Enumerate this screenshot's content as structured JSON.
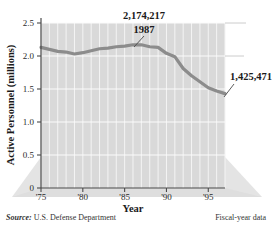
{
  "chart_data": {
    "type": "line",
    "title": "",
    "xlabel": "Year",
    "ylabel": "Active Personnel (millions)",
    "xlim": [
      1975,
      1997
    ],
    "ylim": [
      0,
      2.5
    ],
    "grid": true,
    "legend": "none",
    "x": [
      1975,
      1976,
      1977,
      1978,
      1979,
      1980,
      1981,
      1982,
      1983,
      1984,
      1985,
      1986,
      1987,
      1988,
      1989,
      1990,
      1991,
      1992,
      1993,
      1994,
      1995,
      1996,
      1997
    ],
    "values": [
      2.13,
      2.1,
      2.07,
      2.06,
      2.03,
      2.05,
      2.08,
      2.11,
      2.12,
      2.14,
      2.15,
      2.17,
      2.17,
      2.14,
      2.13,
      2.04,
      1.99,
      1.81,
      1.7,
      1.61,
      1.52,
      1.47,
      1.43
    ],
    "ytick_labels": [
      "0",
      "0.5",
      "1.0",
      "1.5",
      "2.0",
      "2.5"
    ],
    "ytick_values": [
      0,
      0.5,
      1.0,
      1.5,
      2.0,
      2.5
    ],
    "xtick_labels": [
      "'75",
      "'80",
      "'85",
      "'90",
      "'95"
    ],
    "xtick_values": [
      1975,
      1980,
      1985,
      1990,
      1995
    ],
    "annotations": [
      {
        "id": "peak",
        "value_label": "2,174,217",
        "year_label": "1987",
        "year": 1987,
        "value": 2.174217
      },
      {
        "id": "last",
        "value_label": "1,425,471",
        "year": 1997,
        "value": 1.425471
      }
    ],
    "colors": {
      "line": "#8c8c8c",
      "plot_background": "#d9d9d9",
      "gridline": "#f2f2f2",
      "platform": "#e2e2e2",
      "axis": "#3b3b3b",
      "text": "#1a1a1a"
    }
  },
  "footer": {
    "source_label": "Source:",
    "source_text": "U.S. Defense Department",
    "note": "Fiscal-year data"
  }
}
